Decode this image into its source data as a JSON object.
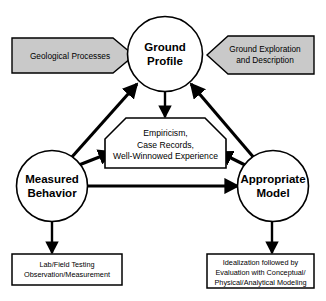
{
  "diagram": {
    "colors": {
      "banner_fill": "#c9c9c9",
      "node_fill": "#ffffff",
      "stroke": "#000000",
      "background": "#ffffff"
    },
    "nodes": [
      {
        "id": "ground-profile",
        "line1": "Ground",
        "line2": "Profile"
      },
      {
        "id": "measured-behavior",
        "line1": "Measured",
        "line2": "Behavior"
      },
      {
        "id": "appropriate-model",
        "line1": "Appropriate",
        "line2": "Model"
      }
    ],
    "banners": [
      {
        "id": "geological-processes",
        "direction": "right",
        "lines": [
          "Geological Processes"
        ]
      },
      {
        "id": "ground-exploration",
        "direction": "left",
        "lines": [
          "Ground Exploration",
          "and Description"
        ]
      }
    ],
    "center_box": {
      "id": "empiricism-box",
      "lines": [
        "Empiricism,",
        "Case Records,",
        "Well-Winnowed Experience"
      ]
    },
    "boxes": [
      {
        "id": "lab-field-testing-box",
        "lines": [
          "Lab/Field Testing",
          "Observation/Measurement"
        ]
      },
      {
        "id": "idealization-box",
        "lines": [
          "Idealization followed by",
          "Evaluation with Conceptual/",
          "Physical/Analytical Modeling"
        ]
      }
    ],
    "connectors": [
      {
        "id": "ground-profile-to-center",
        "kind": "double-headed-vertical"
      },
      {
        "id": "measured-behavior-to-ground-profile",
        "kind": "double-headed-diagonal"
      },
      {
        "id": "measured-behavior-to-center",
        "kind": "double-headed-diagonal"
      },
      {
        "id": "appropriate-model-to-ground-profile",
        "kind": "double-headed-diagonal"
      },
      {
        "id": "appropriate-model-to-center",
        "kind": "double-headed-diagonal"
      },
      {
        "id": "measured-behavior-to-appropriate-model",
        "kind": "double-headed-horizontal"
      },
      {
        "id": "measured-behavior-to-lab-box",
        "kind": "double-headed-vertical"
      },
      {
        "id": "appropriate-model-to-idealization-box",
        "kind": "double-headed-vertical"
      }
    ]
  }
}
